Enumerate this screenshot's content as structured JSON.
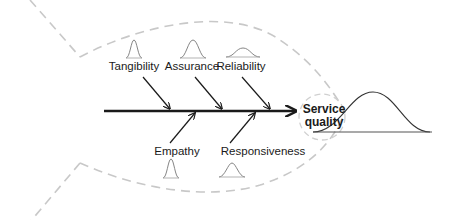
{
  "diagram": {
    "type": "fishbone",
    "effect": {
      "label_line1": "Service",
      "label_line2": "quality"
    },
    "causes_top": [
      {
        "label": "Tangibility"
      },
      {
        "label": "Assurance"
      },
      {
        "label": "Reliability"
      }
    ],
    "causes_bottom": [
      {
        "label": "Empathy"
      },
      {
        "label": "Responsiveness"
      }
    ],
    "colors": {
      "line": "#1a1a1a",
      "outline": "#c8c8c8",
      "curve": "#666666"
    }
  }
}
